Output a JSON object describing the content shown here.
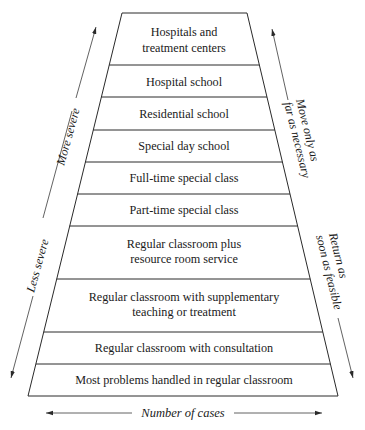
{
  "diagram": {
    "type": "cascade-of-services-trapezoid",
    "tiers": [
      {
        "lines": [
          "Hospitals and",
          "treatment centers"
        ]
      },
      {
        "lines": [
          "Hospital school"
        ]
      },
      {
        "lines": [
          "Residential school"
        ]
      },
      {
        "lines": [
          "Special day school"
        ]
      },
      {
        "lines": [
          "Full-time special class"
        ]
      },
      {
        "lines": [
          "Part-time special class"
        ]
      },
      {
        "lines": [
          "Regular classroom plus",
          "resource room service"
        ]
      },
      {
        "lines": [
          "Regular classroom with supplementary",
          "teaching or treatment"
        ]
      },
      {
        "lines": [
          "Regular classroom with consultation"
        ]
      },
      {
        "lines": [
          "Most problems handled in regular classroom"
        ]
      }
    ],
    "left_axis": {
      "up_label": "More severe",
      "down_label": "Less severe"
    },
    "right_axis": {
      "up_label_lines": [
        "Move only as",
        "far as necessary"
      ],
      "down_label_lines": [
        "Return as",
        "soon as feasible"
      ]
    },
    "bottom_axis": {
      "label": "Number of cases"
    },
    "colors": {
      "ink": "#1a1a1a",
      "background": "#ffffff"
    }
  }
}
